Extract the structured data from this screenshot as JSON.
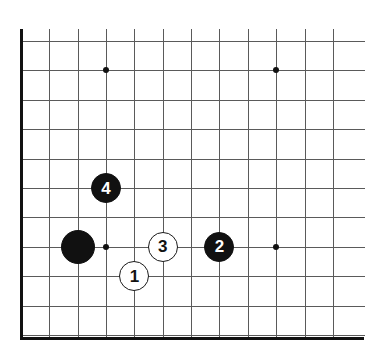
{
  "figure": {
    "kind": "go-board-diagram",
    "width": 370,
    "height": 357,
    "background_color": "#ffffff",
    "line_color": "#5a5a5a",
    "edge_color": "#111111"
  },
  "board": {
    "origin_x": 21,
    "origin_y": 41,
    "col_spacing": 28.35,
    "row_spacing": 29.4,
    "cols": 12,
    "rows": 11,
    "left_edge_thick": true,
    "bottom_edge_thick": true,
    "top_edge_thick": false,
    "right_edge_thick": false,
    "star_points": [
      {
        "name": "star-upper-left",
        "col": 3,
        "row": 1
      },
      {
        "name": "star-upper-right",
        "col": 9,
        "row": 1
      },
      {
        "name": "star-lower-left",
        "col": 3,
        "row": 7
      },
      {
        "name": "star-lower-right",
        "col": 9,
        "row": 7
      }
    ]
  },
  "stones": [
    {
      "name": "black-stone-unnumbered",
      "color": "black",
      "label": "",
      "col": 2,
      "row": 7,
      "radius": 17
    },
    {
      "name": "black-stone-4",
      "color": "black",
      "label": "4",
      "col": 3,
      "row": 5,
      "radius": 15
    },
    {
      "name": "white-stone-1",
      "color": "white",
      "label": "1",
      "col": 4,
      "row": 8,
      "radius": 15
    },
    {
      "name": "white-stone-3",
      "color": "white",
      "label": "3",
      "col": 5,
      "row": 7,
      "radius": 15
    },
    {
      "name": "black-stone-2",
      "color": "black",
      "label": "2",
      "col": 7,
      "row": 7,
      "radius": 15
    }
  ]
}
